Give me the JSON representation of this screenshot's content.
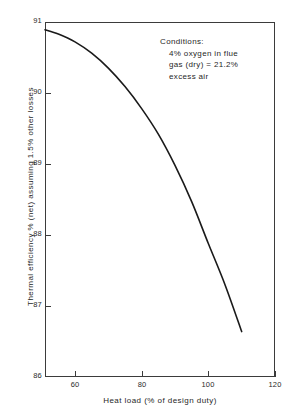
{
  "chart_data": {
    "type": "line",
    "title": "",
    "xlabel": "Heat load (% of design duty)",
    "ylabel": "Thermal efficiency % (net) assuming 1.5% other losses",
    "xlim": [
      51,
      120
    ],
    "ylim": [
      86,
      91
    ],
    "grid": false,
    "legend": null,
    "xticks": [
      60,
      80,
      100,
      120
    ],
    "xtick_labels": [
      "60",
      "80",
      "100",
      "120"
    ],
    "yticks": [
      86,
      87,
      88,
      89,
      90,
      91
    ],
    "ytick_labels": [
      "86",
      "87",
      "88",
      "89",
      "90",
      "91"
    ],
    "series": [
      {
        "name": "Thermal efficiency vs heat load",
        "x": [
          51,
          55,
          60,
          65,
          70,
          75,
          80,
          85,
          90,
          95,
          100,
          105,
          110
        ],
        "y": [
          90.89,
          90.83,
          90.72,
          90.56,
          90.35,
          90.09,
          89.78,
          89.42,
          88.98,
          88.47,
          87.88,
          87.3,
          86.64
        ]
      }
    ],
    "annotations": [
      {
        "name": "conditions-note",
        "lines": [
          "Conditions:",
          "4% oxygen in flue",
          "gas (dry) = 21.2%",
          "excess air"
        ]
      }
    ],
    "colors": {
      "curve": "#1a1a1a",
      "axis": "#3b3b3b",
      "text": "#1f1f1f",
      "background": "#ffffff"
    }
  },
  "axes": {
    "x_title": "Heat load (% of design duty)",
    "y_title": "Thermal efficiency % (net) assuming 1.5% other losses",
    "x_tick_labels": [
      "60",
      "80",
      "100",
      "120"
    ],
    "y_tick_labels": [
      "91",
      "90",
      "89",
      "88",
      "87",
      "86"
    ]
  },
  "conditions": {
    "heading": "Conditions:",
    "line1": "4% oxygen in flue",
    "line2": "gas (dry) = 21.2%",
    "line3": "excess air"
  }
}
